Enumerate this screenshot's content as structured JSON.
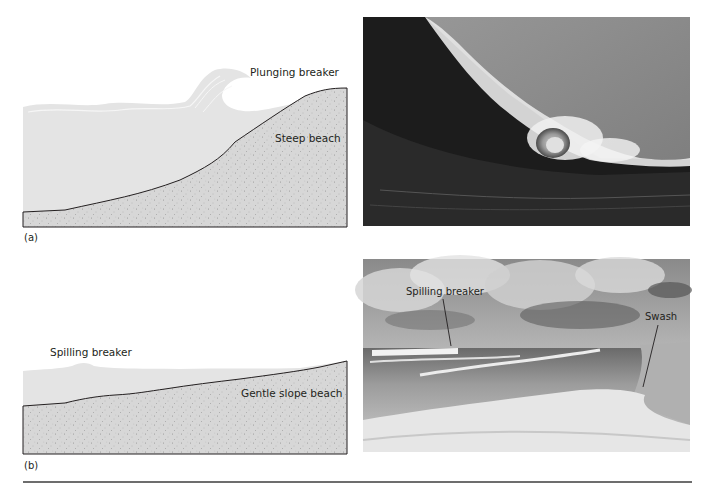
{
  "figure": {
    "panels": [
      {
        "id": "a",
        "panel_label": "(a)",
        "diagram": {
          "breaker_label": "Plunging breaker",
          "beach_label": "Steep beach"
        },
        "photo": {
          "description": "Photograph of a large plunging breaker curling over to form a tube"
        }
      },
      {
        "id": "b",
        "panel_label": "(b)",
        "diagram": {
          "breaker_label": "Spilling breaker",
          "beach_label": "Gentle slope beach"
        },
        "photo": {
          "description": "Photograph of a gently sloping beach with spilling breakers and swash",
          "annotations": [
            "Spilling breaker",
            "Swash"
          ]
        }
      }
    ],
    "colors": {
      "water": "#e4e4e4",
      "sand": "#d6d6d6",
      "outline": "#231f20",
      "rule": "#6d6d6d"
    }
  }
}
